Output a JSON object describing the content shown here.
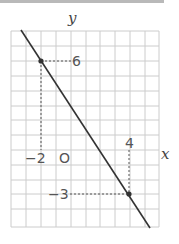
{
  "figure": {
    "axis_labels": {
      "x": "x",
      "y": "y"
    },
    "origin_label": "O",
    "tick_labels": {
      "x_neg": "−2",
      "x_pos": "4",
      "y_pos": "6",
      "y_neg": "−3"
    },
    "points": [
      {
        "label": "(-2, 6)",
        "x": -2,
        "y": 6
      },
      {
        "label": "(4, -3)",
        "x": 4,
        "y": -3
      }
    ],
    "line": {
      "slope": -1.5,
      "intercept": 3,
      "equation": "y = -3/2 x + 3"
    },
    "grid": {
      "x_range": [
        -3,
        7
      ],
      "y_range": [
        -5,
        8
      ],
      "spacing": 1
    },
    "colors": {
      "grid": "#c8c8c8",
      "line": "#333333",
      "dashed": "#555555"
    }
  }
}
